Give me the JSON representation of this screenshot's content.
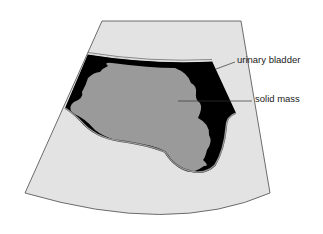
{
  "diagram": {
    "type": "ultrasound-sector-scan",
    "labels": [
      {
        "id": "urinary-bladder",
        "text": "urinary bladder"
      },
      {
        "id": "solid-mass",
        "text": "solid mass"
      }
    ],
    "colors": {
      "background": "#ffffff",
      "tissue": "#e3e3e3",
      "bladder_fluid": "#000000",
      "mass": "#9a9a9a",
      "outline": "#4a4a4a"
    }
  }
}
